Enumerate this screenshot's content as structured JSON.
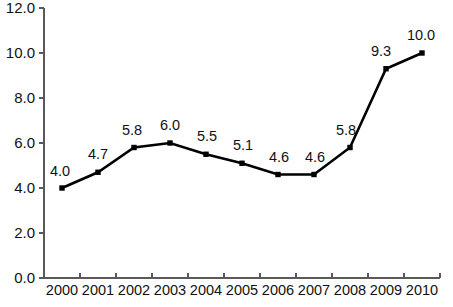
{
  "chart_data": {
    "type": "line",
    "title": "",
    "subtitle": "",
    "xlabel": "",
    "ylabel": "",
    "categories": [
      "2000",
      "2001",
      "2002",
      "2003",
      "2004",
      "2005",
      "2006",
      "2007",
      "2008",
      "2009",
      "2010"
    ],
    "values": [
      4.0,
      4.7,
      5.8,
      6.0,
      5.5,
      5.1,
      4.6,
      4.6,
      5.8,
      9.3,
      10.0
    ],
    "point_labels": [
      "4.0",
      "4.7",
      "5.8",
      "6.0",
      "5.5",
      "5.1",
      "4.6",
      "4.6",
      "5.8",
      "9.3",
      "10.0"
    ],
    "ylim": [
      0.0,
      12.0
    ],
    "ytick_values": [
      0.0,
      2.0,
      4.0,
      6.0,
      8.0,
      10.0,
      12.0
    ],
    "ytick_labels": [
      "0.0",
      "2.0",
      "4.0",
      "6.0",
      "8.0",
      "10.0",
      "12.0"
    ],
    "grid": false,
    "legend": "none",
    "series": [
      {
        "name": "",
        "values": [
          4.0,
          4.7,
          5.8,
          6.0,
          5.5,
          5.1,
          4.6,
          4.6,
          5.8,
          9.3,
          10.0
        ],
        "color": "#000000",
        "marker": "square"
      }
    ],
    "colors": {
      "line": "#000000",
      "marker": "#000000",
      "axis": "#59595b",
      "label_text": "#111111",
      "background": "#ffffff"
    }
  }
}
